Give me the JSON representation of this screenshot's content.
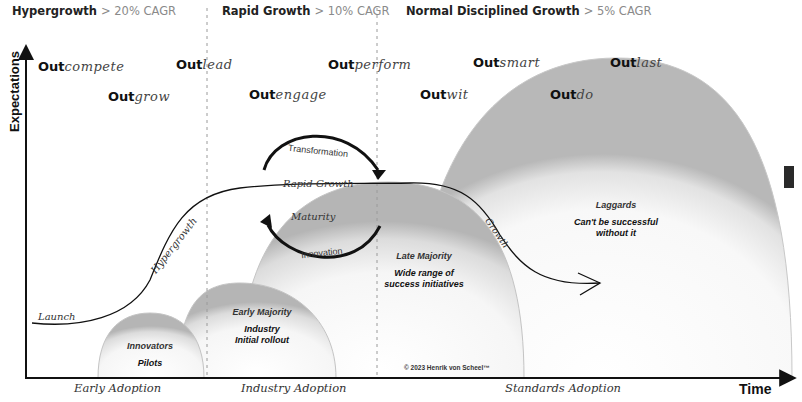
{
  "phases": [
    {
      "name": "Hypergrowth",
      "rate": "> 20% CAGR"
    },
    {
      "name": "Rapid Growth",
      "rate": "> 10% CAGR"
    },
    {
      "name": "Normal Disciplined Growth",
      "rate": "> 5% CAGR"
    }
  ],
  "axes": {
    "y_label": "Expectations",
    "x_label": "Time"
  },
  "strategies": [
    {
      "prefix": "Out",
      "verb": "compete"
    },
    {
      "prefix": "Out",
      "verb": "grow"
    },
    {
      "prefix": "Out",
      "verb": "lead"
    },
    {
      "prefix": "Out",
      "verb": "engage"
    },
    {
      "prefix": "Out",
      "verb": "perform"
    },
    {
      "prefix": "Out",
      "verb": "wit"
    },
    {
      "prefix": "Out",
      "verb": "smart"
    },
    {
      "prefix": "Out",
      "verb": "do"
    },
    {
      "prefix": "Out",
      "verb": "last"
    }
  ],
  "segments": [
    {
      "name": "Innovators",
      "desc": "Pilots"
    },
    {
      "name": "Early Majority",
      "desc": "Industry\nInitial rollout"
    },
    {
      "name": "Late Majority",
      "desc": "Wide range of\nsuccess initiatives"
    },
    {
      "name": "Laggards",
      "desc": "Can't be successful\nwithout it"
    }
  ],
  "curve_labels": {
    "launch": "Launch",
    "hypergrowth": "Hypergrowth",
    "rapid_growth": "Rapid Growth",
    "maturity": "Maturity",
    "growth": "Growth"
  },
  "cycle_labels": {
    "transformation": "Transformation",
    "innovation": "Innovation"
  },
  "adoption_stages": [
    "Early Adoption",
    "Industry Adoption",
    "Standards Adoption"
  ],
  "copyright": "© 2023 Henrik von Scheel™",
  "colors": {
    "background": "#ffffff",
    "text": "#111111",
    "rate_text": "#8a8a8a",
    "divider": "#9a9a9a"
  }
}
